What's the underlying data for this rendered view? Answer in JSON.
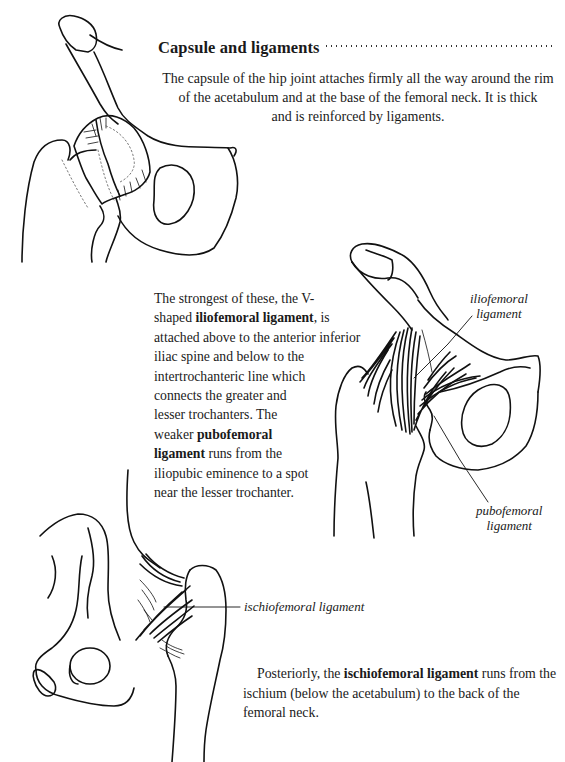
{
  "section": {
    "title": "Capsule and ligaments",
    "intro_lines": [
      "The capsule of the hip joint attaches firmly all the way around the rim",
      "of the acetabulum and at the base of the femoral neck. It is thick",
      "and is reinforced by ligaments."
    ]
  },
  "middle_paragraph": {
    "lines": [
      {
        "pre": "The strongest of these, the V-",
        "bold": "",
        "post": ""
      },
      {
        "pre": "shaped ",
        "bold": "iliofemoral ligament",
        "post": ", is"
      },
      {
        "pre": "attached above to the anterior inferior",
        "bold": "",
        "post": ""
      },
      {
        "pre": "iliac spine and below to the",
        "bold": "",
        "post": ""
      },
      {
        "pre": "intertrochanteric line which",
        "bold": "",
        "post": ""
      },
      {
        "pre": "connects the greater and",
        "bold": "",
        "post": ""
      },
      {
        "pre": "lesser trochanters. The",
        "bold": "",
        "post": ""
      },
      {
        "pre": "weaker ",
        "bold": "pubofemoral",
        "post": ""
      },
      {
        "pre": "",
        "bold": "ligament",
        "post": " runs from the"
      },
      {
        "pre": "iliopubic eminence to a spot",
        "bold": "",
        "post": ""
      },
      {
        "pre": "near the lesser trochanter.",
        "bold": "",
        "post": ""
      }
    ]
  },
  "posterior_paragraph": {
    "lines": [
      {
        "pre": "Posteriorly, the ",
        "bold": "ischiofemoral ligament",
        "post": " runs from the"
      },
      {
        "pre": "ischium (below the acetabulum) to the back of the",
        "bold": "",
        "post": ""
      },
      {
        "pre": "femoral neck.",
        "bold": "",
        "post": ""
      }
    ]
  },
  "figure_labels": {
    "iliofemoral": [
      "iliofemoral",
      "ligament"
    ],
    "pubofemoral": [
      "pubofemoral",
      "ligament"
    ],
    "ischiofemoral": "ischiofemoral ligament"
  },
  "figures": [
    {
      "name": "hip-capsule-anterior",
      "icon": "hip-joint-capsule-illustration"
    },
    {
      "name": "hip-ligaments-anterior",
      "icon": "iliofemoral-pubofemoral-illustration"
    },
    {
      "name": "hip-ligaments-posterior",
      "icon": "ischiofemoral-illustration"
    }
  ]
}
